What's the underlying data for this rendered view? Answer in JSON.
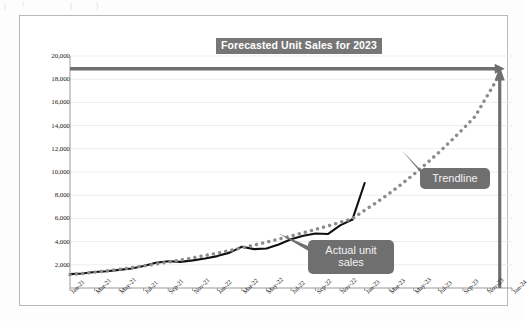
{
  "chart_data": {
    "type": "line",
    "title": "Forecasted Unit Sales for 2023",
    "xlabel": "",
    "ylabel": "",
    "ylim": [
      0,
      20000
    ],
    "ytick_step": 2000,
    "grid": true,
    "legend_position": "none",
    "x_categories": [
      "Jan-21",
      "Mar-21",
      "May-21",
      "Jul-21",
      "Sep-21",
      "Nov-21",
      "Jan-22",
      "Mar-22",
      "May-22",
      "Jul-22",
      "Sep-22",
      "Nov-22",
      "Jan-23",
      "Mar-23",
      "May-23",
      "Jul-23",
      "Sep-23",
      "Nov-23",
      "Jan-24"
    ],
    "y_tick_labels": [
      "2,000",
      "4,000",
      "6,000",
      "8,000",
      "10,000",
      "12,000",
      "14,000",
      "16,000",
      "18,000",
      "20,000"
    ],
    "x_months": [
      "Jan-21",
      "Feb-21",
      "Mar-21",
      "Apr-21",
      "May-21",
      "Jun-21",
      "Jul-21",
      "Aug-21",
      "Sep-21",
      "Oct-21",
      "Nov-21",
      "Dec-21",
      "Jan-22",
      "Feb-22",
      "Mar-22",
      "Apr-22",
      "May-22",
      "Jun-22",
      "Jul-22",
      "Aug-22",
      "Sep-22",
      "Oct-22",
      "Nov-22",
      "Dec-22",
      "Jan-23",
      "Feb-23",
      "Mar-23",
      "Apr-23",
      "May-23",
      "Jun-23",
      "Jul-23",
      "Aug-23",
      "Sep-23",
      "Oct-23",
      "Nov-23",
      "Dec-23",
      "Jan-24"
    ],
    "series": [
      {
        "name": "Actual unit sales",
        "style": "solid",
        "color": "#111111",
        "x": [
          "Jan-21",
          "Feb-21",
          "Mar-21",
          "Apr-21",
          "May-21",
          "Jun-21",
          "Jul-21",
          "Aug-21",
          "Sep-21",
          "Oct-21",
          "Nov-21",
          "Dec-21",
          "Jan-22",
          "Feb-22",
          "Mar-22",
          "Apr-22",
          "May-22",
          "Jun-22",
          "Jul-22",
          "Aug-22",
          "Sep-22",
          "Oct-22",
          "Nov-22",
          "Dec-22"
        ],
        "values": [
          1200,
          1250,
          1380,
          1450,
          1560,
          1680,
          1900,
          2180,
          2300,
          2250,
          2380,
          2550,
          2750,
          3050,
          3550,
          3350,
          3400,
          3750,
          4200,
          4500,
          4700,
          4650,
          5400,
          5900
        ]
      },
      {
        "name": "Actual unit sales (cont.)",
        "style": "solid",
        "color": "#111111",
        "x": [
          "Dec-22",
          "Jan-23"
        ],
        "values": [
          5900,
          9050
        ]
      },
      {
        "name": "Trendline",
        "style": "dotted",
        "color": "#8c8c8c",
        "x": [
          "Jan-21",
          "Feb-21",
          "Mar-21",
          "Apr-21",
          "May-21",
          "Jun-21",
          "Jul-21",
          "Aug-21",
          "Sep-21",
          "Oct-21",
          "Nov-21",
          "Dec-21",
          "Jan-22",
          "Feb-22",
          "Mar-22",
          "Apr-22",
          "May-22",
          "Jun-22",
          "Jul-22",
          "Aug-22",
          "Sep-22",
          "Oct-22",
          "Nov-22",
          "Dec-22",
          "Jan-23",
          "Feb-23",
          "Mar-23",
          "Apr-23",
          "May-23",
          "Jun-23",
          "Jul-23",
          "Aug-23",
          "Sep-23",
          "Oct-23",
          "Nov-23",
          "Dec-23"
        ],
        "values": [
          1150,
          1250,
          1360,
          1480,
          1610,
          1750,
          1900,
          2060,
          2230,
          2410,
          2600,
          2800,
          3010,
          3230,
          3460,
          3700,
          3950,
          4210,
          4480,
          4760,
          5050,
          5350,
          5660,
          5980,
          6700,
          7400,
          8150,
          8950,
          9800,
          10700,
          11650,
          12650,
          13700,
          14800,
          16600,
          18400
        ]
      }
    ],
    "annotations": [
      {
        "name": "actual-unit-sales-callout",
        "text": "Actual unit\nsales",
        "line1": "Actual unit",
        "line2": "sales",
        "points_to": {
          "x": "Jun-22",
          "y": 4700
        }
      },
      {
        "name": "trendline-callout",
        "text": "Trendline",
        "line1": "Trendline",
        "points_to": {
          "x": "Apr-23",
          "y": 11900
        }
      }
    ],
    "reference_markers": [
      {
        "name": "horizontal-forecast-arrow",
        "orientation": "horizontal",
        "value": 18900,
        "color": "#6f6f6f",
        "arrow": "right"
      },
      {
        "name": "vertical-forecast-arrow",
        "orientation": "vertical",
        "at_x": "Dec-23",
        "to_value": 18400,
        "color": "#6f6f6f",
        "arrow": "up"
      }
    ],
    "colors": {
      "title_background": "#767676",
      "title_text": "#ffffff",
      "actual_line": "#111111",
      "trendline": "#8c8c8c",
      "callout_background": "#6f6f6f",
      "callout_text": "#f2f2f2",
      "gridline": "#ededed",
      "axis": "#9a9a9a",
      "frame_border": "#b9b9b9"
    }
  },
  "scan_artifacts": [
    "|",
    "/",
    "(",
    ")"
  ]
}
